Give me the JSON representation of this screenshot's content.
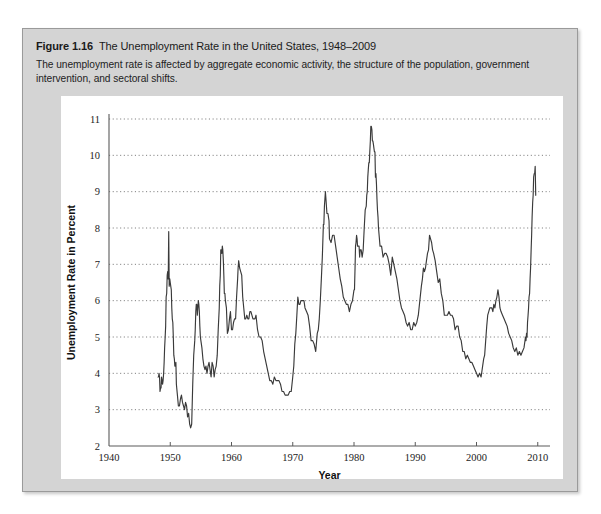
{
  "figure": {
    "label": "Figure 1.16",
    "title": "The Unemployment Rate in the United States, 1948–2009",
    "caption": "The unemployment rate is affected by aggregate economic activity, the structure of the population, government intervention, and sectoral shifts."
  },
  "colors": {
    "panel_background": "#d4d4d4",
    "chart_background": "#ffffff",
    "line": "#3a3a3a",
    "gridline": "#707070",
    "axis": "#5a5a5a",
    "text": "#1a1a1a"
  },
  "chart_data": {
    "type": "line",
    "title": "The Unemployment Rate in the United States, 1948–2009",
    "xlabel": "Year",
    "ylabel": "Unemployment Rate in Percent",
    "xlim": [
      1940,
      2012
    ],
    "ylim": [
      2,
      11
    ],
    "xticks": [
      1940,
      1950,
      1960,
      1970,
      1980,
      1990,
      2000,
      2010
    ],
    "xtick_labels": [
      "1940",
      "1950",
      "1960",
      "1970",
      "1980",
      "1990",
      "2000",
      "2010"
    ],
    "yticks": [
      2,
      3,
      4,
      5,
      6,
      7,
      8,
      9,
      10,
      11
    ],
    "ytick_labels": [
      "2",
      "3",
      "4",
      "5",
      "6",
      "7",
      "8",
      "9",
      "10",
      "11"
    ],
    "grid": "horizontal-dotted",
    "legend": null,
    "series": [
      {
        "name": "Unemployment Rate",
        "color": "#3a3a3a",
        "x": [
          1948.0,
          1948.08,
          1948.17,
          1948.25,
          1948.33,
          1948.42,
          1948.5,
          1948.58,
          1948.67,
          1948.75,
          1948.83,
          1948.92,
          1949.0,
          1949.08,
          1949.17,
          1949.25,
          1949.33,
          1949.42,
          1949.5,
          1949.58,
          1949.67,
          1949.75,
          1949.83,
          1949.92,
          1950.0,
          1950.08,
          1950.17,
          1950.25,
          1950.33,
          1950.42,
          1950.5,
          1950.58,
          1950.67,
          1950.75,
          1950.83,
          1950.92,
          1951.0,
          1951.17,
          1951.33,
          1951.5,
          1951.67,
          1951.83,
          1952.0,
          1952.17,
          1952.33,
          1952.5,
          1952.67,
          1952.83,
          1953.0,
          1953.17,
          1953.33,
          1953.5,
          1953.67,
          1953.83,
          1954.0,
          1954.08,
          1954.17,
          1954.25,
          1954.33,
          1954.42,
          1954.5,
          1954.58,
          1954.67,
          1954.75,
          1954.83,
          1954.92,
          1955.0,
          1955.17,
          1955.33,
          1955.5,
          1955.67,
          1955.83,
          1956.0,
          1956.17,
          1956.33,
          1956.5,
          1956.67,
          1956.83,
          1957.0,
          1957.17,
          1957.33,
          1957.5,
          1957.67,
          1957.83,
          1958.0,
          1958.08,
          1958.17,
          1958.25,
          1958.33,
          1958.42,
          1958.5,
          1958.58,
          1958.67,
          1958.75,
          1958.83,
          1958.92,
          1959.0,
          1959.17,
          1959.33,
          1959.5,
          1959.67,
          1959.83,
          1960.0,
          1960.17,
          1960.33,
          1960.5,
          1960.67,
          1960.83,
          1961.0,
          1961.08,
          1961.17,
          1961.25,
          1961.33,
          1961.5,
          1961.67,
          1961.83,
          1962.0,
          1962.17,
          1962.33,
          1962.5,
          1962.67,
          1962.83,
          1963.0,
          1963.17,
          1963.33,
          1963.5,
          1963.67,
          1963.83,
          1964.0,
          1964.25,
          1964.5,
          1964.75,
          1965.0,
          1965.25,
          1965.5,
          1965.75,
          1966.0,
          1966.25,
          1966.5,
          1966.75,
          1967.0,
          1967.25,
          1967.5,
          1967.75,
          1968.0,
          1968.25,
          1968.5,
          1968.75,
          1969.0,
          1969.25,
          1969.5,
          1969.75,
          1970.0,
          1970.17,
          1970.33,
          1970.5,
          1970.67,
          1970.83,
          1971.0,
          1971.17,
          1971.33,
          1971.5,
          1971.67,
          1971.83,
          1972.0,
          1972.25,
          1972.5,
          1972.75,
          1973.0,
          1973.25,
          1973.5,
          1973.75,
          1974.0,
          1974.17,
          1974.33,
          1974.5,
          1974.67,
          1974.83,
          1975.0,
          1975.08,
          1975.17,
          1975.25,
          1975.33,
          1975.42,
          1975.5,
          1975.58,
          1975.67,
          1975.75,
          1975.83,
          1975.92,
          1976.0,
          1976.25,
          1976.5,
          1976.75,
          1977.0,
          1977.25,
          1977.5,
          1977.75,
          1978.0,
          1978.25,
          1978.5,
          1978.75,
          1979.0,
          1979.25,
          1979.5,
          1979.75,
          1980.0,
          1980.08,
          1980.17,
          1980.25,
          1980.33,
          1980.42,
          1980.5,
          1980.58,
          1980.67,
          1980.75,
          1980.83,
          1980.92,
          1981.0,
          1981.17,
          1981.33,
          1981.5,
          1981.67,
          1981.83,
          1982.0,
          1982.08,
          1982.17,
          1982.25,
          1982.33,
          1982.42,
          1982.5,
          1982.58,
          1982.67,
          1982.75,
          1982.83,
          1982.92,
          1983.0,
          1983.08,
          1983.17,
          1983.25,
          1983.33,
          1983.42,
          1983.5,
          1983.58,
          1983.67,
          1983.75,
          1983.83,
          1983.92,
          1984.0,
          1984.25,
          1984.5,
          1984.75,
          1985.0,
          1985.25,
          1985.5,
          1985.75,
          1986.0,
          1986.25,
          1986.5,
          1986.75,
          1987.0,
          1987.25,
          1987.5,
          1987.75,
          1988.0,
          1988.25,
          1988.5,
          1988.75,
          1989.0,
          1989.25,
          1989.5,
          1989.75,
          1990.0,
          1990.25,
          1990.5,
          1990.75,
          1991.0,
          1991.17,
          1991.33,
          1991.5,
          1991.67,
          1991.83,
          1992.0,
          1992.17,
          1992.33,
          1992.5,
          1992.67,
          1992.83,
          1993.0,
          1993.25,
          1993.5,
          1993.75,
          1994.0,
          1994.25,
          1994.5,
          1994.75,
          1995.0,
          1995.25,
          1995.5,
          1995.75,
          1996.0,
          1996.25,
          1996.5,
          1996.75,
          1997.0,
          1997.25,
          1997.5,
          1997.75,
          1998.0,
          1998.25,
          1998.5,
          1998.75,
          1999.0,
          1999.25,
          1999.5,
          1999.75,
          2000.0,
          2000.25,
          2000.5,
          2000.75,
          2001.0,
          2001.17,
          2001.33,
          2001.5,
          2001.67,
          2001.83,
          2002.0,
          2002.17,
          2002.33,
          2002.5,
          2002.67,
          2002.83,
          2003.0,
          2003.17,
          2003.33,
          2003.5,
          2003.67,
          2003.83,
          2004.0,
          2004.25,
          2004.5,
          2004.75,
          2005.0,
          2005.25,
          2005.5,
          2005.75,
          2006.0,
          2006.25,
          2006.5,
          2006.75,
          2007.0,
          2007.25,
          2007.5,
          2007.75,
          2008.0,
          2008.08,
          2008.17,
          2008.25,
          2008.33,
          2008.42,
          2008.5,
          2008.58,
          2008.67,
          2008.75,
          2008.83,
          2008.92,
          2009.0,
          2009.08,
          2009.17,
          2009.25,
          2009.33,
          2009.42,
          2009.5,
          2009.58,
          2009.67
        ],
        "y": [
          3.9,
          3.9,
          4.0,
          3.9,
          3.5,
          3.6,
          3.6,
          3.9,
          3.8,
          3.7,
          3.8,
          4.0,
          4.3,
          4.7,
          5.0,
          5.3,
          6.1,
          6.2,
          6.7,
          6.8,
          6.6,
          7.9,
          6.4,
          6.6,
          6.5,
          6.4,
          6.3,
          5.8,
          5.5,
          5.4,
          5.0,
          4.5,
          4.4,
          4.2,
          4.2,
          4.3,
          3.7,
          3.4,
          3.1,
          3.1,
          3.3,
          3.4,
          3.2,
          3.1,
          3.0,
          3.2,
          3.1,
          2.8,
          2.9,
          2.6,
          2.5,
          2.6,
          3.7,
          4.5,
          4.9,
          5.2,
          5.7,
          5.9,
          5.9,
          5.6,
          5.8,
          6.0,
          5.9,
          5.7,
          5.3,
          5.0,
          4.9,
          4.7,
          4.4,
          4.2,
          4.1,
          4.2,
          4.0,
          4.2,
          4.3,
          4.1,
          3.9,
          4.3,
          4.2,
          3.9,
          4.1,
          4.2,
          4.5,
          5.2,
          5.8,
          6.4,
          6.7,
          7.4,
          7.4,
          7.3,
          7.5,
          7.4,
          7.1,
          6.7,
          6.2,
          6.2,
          6.0,
          5.8,
          5.1,
          5.2,
          5.5,
          5.7,
          5.2,
          5.2,
          5.4,
          5.5,
          5.5,
          6.1,
          6.6,
          6.9,
          7.1,
          7.0,
          6.9,
          6.8,
          6.7,
          6.1,
          5.8,
          5.5,
          5.5,
          5.6,
          5.5,
          5.5,
          5.7,
          5.7,
          5.6,
          5.5,
          5.5,
          5.5,
          5.6,
          5.2,
          5.0,
          5.0,
          4.9,
          4.6,
          4.4,
          4.2,
          4.0,
          3.8,
          3.8,
          3.7,
          3.9,
          3.8,
          3.8,
          3.8,
          3.7,
          3.5,
          3.5,
          3.4,
          3.4,
          3.4,
          3.5,
          3.5,
          3.9,
          4.2,
          4.8,
          5.1,
          5.6,
          6.1,
          5.9,
          5.9,
          6.0,
          6.0,
          6.0,
          6.0,
          5.8,
          5.7,
          5.6,
          5.3,
          4.9,
          4.9,
          4.8,
          4.6,
          5.1,
          5.2,
          5.5,
          6.0,
          6.6,
          7.2,
          8.1,
          8.1,
          8.6,
          8.8,
          9.0,
          8.8,
          8.6,
          8.4,
          8.4,
          8.4,
          8.3,
          8.2,
          7.7,
          7.6,
          7.8,
          7.8,
          7.5,
          7.2,
          6.9,
          6.6,
          6.4,
          6.1,
          6.0,
          5.9,
          5.9,
          5.7,
          5.9,
          6.0,
          6.3,
          6.3,
          6.9,
          7.5,
          7.6,
          7.8,
          7.7,
          7.5,
          7.5,
          7.5,
          7.5,
          7.2,
          7.4,
          7.4,
          7.2,
          7.4,
          8.0,
          8.5,
          8.6,
          8.9,
          9.0,
          9.4,
          9.6,
          9.8,
          9.8,
          10.1,
          10.4,
          10.8,
          10.8,
          10.7,
          10.4,
          10.4,
          10.3,
          10.2,
          10.1,
          10.1,
          9.4,
          9.5,
          9.2,
          8.8,
          8.5,
          8.3,
          8.0,
          7.5,
          7.5,
          7.2,
          7.3,
          7.3,
          7.2,
          7.0,
          6.7,
          7.2,
          7.0,
          6.8,
          6.6,
          6.3,
          6.0,
          5.8,
          5.7,
          5.6,
          5.4,
          5.3,
          5.4,
          5.2,
          5.2,
          5.4,
          5.3,
          5.4,
          5.6,
          6.0,
          6.4,
          6.6,
          6.9,
          6.8,
          6.9,
          7.1,
          7.3,
          7.4,
          7.8,
          7.7,
          7.6,
          7.4,
          7.3,
          7.1,
          6.8,
          6.5,
          6.6,
          6.2,
          6.0,
          5.6,
          5.6,
          5.6,
          5.7,
          5.6,
          5.6,
          5.5,
          5.2,
          5.3,
          5.3,
          5.0,
          4.9,
          4.6,
          4.6,
          4.4,
          4.5,
          4.4,
          4.3,
          4.3,
          4.2,
          4.1,
          4.0,
          3.9,
          4.0,
          3.9,
          4.2,
          4.4,
          4.5,
          4.9,
          5.3,
          5.6,
          5.7,
          5.8,
          5.8,
          5.8,
          5.7,
          5.9,
          5.8,
          6.0,
          6.1,
          6.3,
          6.1,
          5.8,
          5.7,
          5.6,
          5.5,
          5.4,
          5.3,
          5.1,
          5.0,
          4.9,
          4.7,
          4.6,
          4.7,
          4.5,
          4.6,
          4.5,
          4.6,
          4.7,
          5.0,
          4.9,
          5.1,
          5.0,
          5.4,
          5.6,
          5.8,
          6.1,
          6.2,
          6.6,
          6.9,
          7.4,
          7.8,
          8.3,
          8.7,
          8.9,
          9.4,
          9.5,
          9.5,
          9.7,
          8.9
        ]
      }
    ]
  }
}
